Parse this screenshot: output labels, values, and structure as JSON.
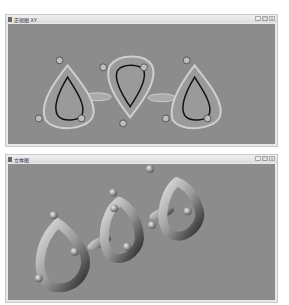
{
  "windows": [
    {
      "title": "正视图 XY",
      "controls": [
        "_",
        "□",
        "×"
      ],
      "view": "2d-front",
      "description": "three teardrop rings connected by two bonds, front view"
    },
    {
      "title": "立体图",
      "controls": [
        "_",
        "□",
        "×"
      ],
      "view": "3d-perspective",
      "description": "three teardrop rings connected by two bonds, shaded 3D view"
    }
  ],
  "colors": {
    "background": "#8c8c8c",
    "ring_fill": "#9a9a9a",
    "ring_outline": "#cfcfcf",
    "inner_line": "#111111",
    "node": "#bdbdbd"
  }
}
